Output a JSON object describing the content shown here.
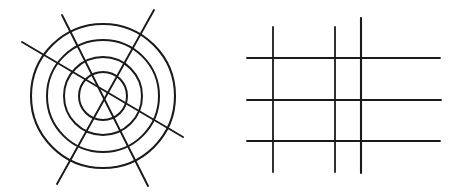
{
  "figure": {
    "background_color": "#ffffff",
    "stroke_color": "#1a1a1a",
    "canvas": {
      "width": 461,
      "height": 195
    },
    "panels": [
      {
        "name": "concentric-circles-panel",
        "label": "Concentric circles with crossing straight lines",
        "center": {
          "x": 103,
          "y": 96
        },
        "circles": [
          {
            "name": "circle-outer",
            "radius": 72,
            "stroke_width": 2.1
          },
          {
            "name": "circle-third",
            "radius": 56,
            "stroke_width": 2.0
          },
          {
            "name": "circle-second",
            "radius": 39,
            "stroke_width": 2.0
          },
          {
            "name": "circle-inner",
            "radius": 24,
            "stroke_width": 2.0
          }
        ],
        "lines": [
          {
            "name": "radial-line-1",
            "x1": 22,
            "y1": 42,
            "x2": 183,
            "y2": 137,
            "stroke_width": 1.9
          },
          {
            "name": "radial-line-2",
            "x1": 62,
            "y1": 15,
            "x2": 148,
            "y2": 186,
            "stroke_width": 1.9
          },
          {
            "name": "radial-line-3",
            "x1": 154,
            "y1": 10,
            "x2": 57,
            "y2": 184,
            "stroke_width": 1.9
          }
        ]
      },
      {
        "name": "grid-panel",
        "label": "Rectangular grid of three vertical and three horizontal lines",
        "vertical_lines": [
          {
            "name": "grid-vertical-1",
            "x": 273,
            "y1": 27,
            "y2": 172,
            "stroke_width": 1.8
          },
          {
            "name": "grid-vertical-2",
            "x": 335,
            "y1": 27,
            "y2": 172,
            "stroke_width": 1.8
          },
          {
            "name": "grid-vertical-3",
            "x": 361,
            "y1": 18,
            "y2": 173,
            "stroke_width": 2.1
          }
        ],
        "horizontal_lines": [
          {
            "name": "grid-horizontal-1",
            "y": 58,
            "x1": 247,
            "x2": 440,
            "stroke_width": 1.8
          },
          {
            "name": "grid-horizontal-2",
            "y": 100,
            "x1": 247,
            "x2": 441,
            "stroke_width": 1.8
          },
          {
            "name": "grid-horizontal-3",
            "y": 141,
            "x1": 247,
            "x2": 440,
            "stroke_width": 1.8
          }
        ]
      }
    ]
  }
}
